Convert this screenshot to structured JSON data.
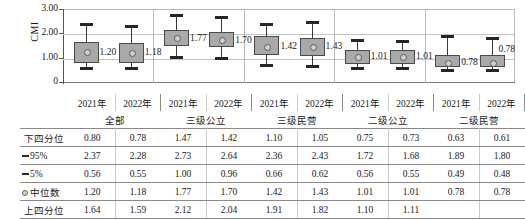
{
  "chart_data": {
    "type": "box",
    "title": "",
    "ylabel": "CMI",
    "xlabel": "",
    "ylim": [
      0,
      3.0
    ],
    "yticks": [
      "0",
      "1.00",
      "2.00",
      "3.00"
    ],
    "grid": true,
    "legend": "none",
    "groups": [
      {
        "name": "全部",
        "years": [
          "2021年",
          "2022年"
        ]
      },
      {
        "name": "三级公立",
        "years": [
          "2021年",
          "2022年"
        ]
      },
      {
        "name": "三级民营",
        "years": [
          "2021年",
          "2022年"
        ]
      },
      {
        "name": "二级公立",
        "years": [
          "2021年",
          "2022年"
        ]
      },
      {
        "name": "二级民营",
        "years": [
          "2021年",
          "2022年"
        ]
      }
    ],
    "categories": [
      "全部 2021年",
      "全部 2022年",
      "三级公立 2021年",
      "三级公立 2022年",
      "三级民营 2021年",
      "三级民营 2022年",
      "二级公立 2021年",
      "二级公立 2022年",
      "二级民营 2021年",
      "二级民营 2022年"
    ],
    "boxes": [
      {
        "group": "全部",
        "year": "2021年",
        "p5": 0.56,
        "q1": 0.8,
        "median": 1.2,
        "q3": 1.64,
        "p95": 2.37,
        "label": "1.20"
      },
      {
        "group": "全部",
        "year": "2022年",
        "p5": 0.55,
        "q1": 0.78,
        "median": 1.18,
        "q3": 1.59,
        "p95": 2.28,
        "label": "1.18"
      },
      {
        "group": "三级公立",
        "year": "2021年",
        "p5": 1.0,
        "q1": 1.47,
        "median": 1.77,
        "q3": 2.12,
        "p95": 2.73,
        "label": "1.77"
      },
      {
        "group": "三级公立",
        "year": "2022年",
        "p5": 0.96,
        "q1": 1.42,
        "median": 1.7,
        "q3": 2.04,
        "p95": 2.64,
        "label": "1.70"
      },
      {
        "group": "三级民营",
        "year": "2021年",
        "p5": 0.66,
        "q1": 1.1,
        "median": 1.42,
        "q3": 1.91,
        "p95": 2.36,
        "label": "1.42"
      },
      {
        "group": "三级民营",
        "year": "2022年",
        "p5": 0.62,
        "q1": 1.05,
        "median": 1.43,
        "q3": 1.82,
        "p95": 2.43,
        "label": "1.43"
      },
      {
        "group": "二级公立",
        "year": "2021年",
        "p5": 0.56,
        "q1": 0.75,
        "median": 1.01,
        "q3": 1.32,
        "p95": 1.72,
        "label": "1.01"
      },
      {
        "group": "二级公立",
        "year": "2022年",
        "p5": 0.55,
        "q1": 0.73,
        "median": 1.01,
        "q3": 1.3,
        "p95": 1.68,
        "label": "1.01"
      },
      {
        "group": "二级民营",
        "year": "2021年",
        "p5": 0.49,
        "q1": 0.63,
        "median": 0.78,
        "q3": 1.1,
        "p95": 1.89,
        "label": "0.78"
      },
      {
        "group": "二级民营",
        "year": "2022年",
        "p5": 0.48,
        "q1": 0.61,
        "median": 0.78,
        "q3": 1.11,
        "p95": 1.8,
        "label": "0.78"
      }
    ]
  },
  "table": {
    "header": {
      "corner": "",
      "year_labels": [
        "2021年",
        "2022年",
        "2021年",
        "2022年",
        "2021年",
        "2022年",
        "2021年",
        "2022年",
        "2021年",
        "2022年"
      ],
      "group_labels": [
        "全部",
        "三级公立",
        "三级民营",
        "二级公立",
        "二级民营"
      ]
    },
    "rows": [
      {
        "label": "下四分位",
        "marker": "none",
        "values": [
          "0.80",
          "0.78",
          "1.47",
          "1.42",
          "1.10",
          "1.05",
          "0.75",
          "0.73",
          "0.63",
          "0.61"
        ]
      },
      {
        "label": "95%",
        "marker": "dash",
        "values": [
          "2.37",
          "2.28",
          "2.73",
          "2.64",
          "2.36",
          "2.43",
          "1.72",
          "1.68",
          "1.89",
          "1.80"
        ]
      },
      {
        "label": "5%",
        "marker": "dash",
        "values": [
          "0.56",
          "0.55",
          "1.00",
          "0.96",
          "0.66",
          "0.62",
          "0.56",
          "0.55",
          "0.49",
          "0.48"
        ]
      },
      {
        "label": "中位数",
        "marker": "dot",
        "values": [
          "1.20",
          "1.18",
          "1.77",
          "1.70",
          "1.42",
          "1.43",
          "1.01",
          "1.01",
          "0.78",
          "0.78"
        ]
      },
      {
        "label": "上四分位",
        "marker": "none",
        "values": [
          "1.64",
          "1.59",
          "2.12",
          "2.04",
          "1.91",
          "1.82",
          "1.10",
          "1.11"
        ]
      }
    ]
  },
  "colors": {
    "box_fill": "#a9a9a9",
    "box_stroke": "#4a4a4a",
    "whisker": "#3a3a3a",
    "grid": "#c2c2c2",
    "axis": "#555555"
  }
}
